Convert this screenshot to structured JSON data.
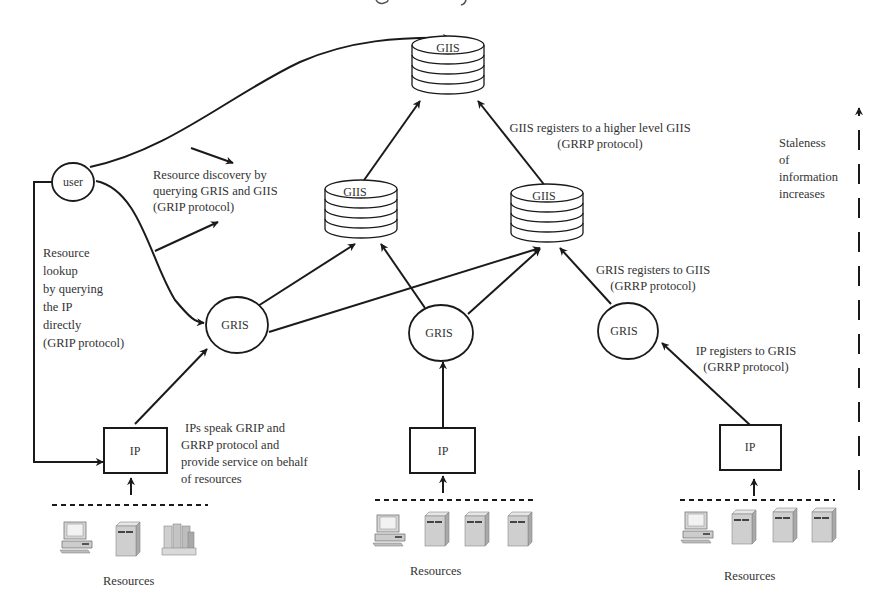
{
  "nodes": {
    "giis_top": {
      "label": "GIIS"
    },
    "giis_left": {
      "label": "GIIS"
    },
    "giis_right": {
      "label": "GIIS"
    },
    "user": {
      "label": "user"
    },
    "gris_left": {
      "label": "GRIS"
    },
    "gris_mid": {
      "label": "GRIS"
    },
    "gris_right": {
      "label": "GRIS"
    },
    "ip_left": {
      "label": "IP"
    },
    "ip_mid": {
      "label": "IP"
    },
    "ip_right": {
      "label": "IP"
    }
  },
  "annotations": {
    "discovery": [
      "Resource discovery by",
      "querying GRIS and GIIS",
      "(GRIP protocol)"
    ],
    "lookup": [
      "Resource",
      "lookup",
      "by querying",
      "the IP",
      "directly",
      "(GRIP protocol)"
    ],
    "giis_register": [
      "GIIS registers to a higher level GIIS",
      "(GRRP protocol)"
    ],
    "gris_register": [
      "GRIS registers to GIIS",
      "(GRRP protocol)"
    ],
    "ip_register": [
      "IP registers to GRIS",
      "(GRRP protocol)"
    ],
    "ip_speak": [
      "IPs speak GRIP and",
      "GRRP protocol and",
      "provide service on behalf",
      "of resources"
    ],
    "staleness": [
      "Staleness",
      "of",
      "information",
      "increases"
    ]
  },
  "resources": {
    "left": {
      "label": "Resources",
      "items": [
        "workstation-icon",
        "server-icon",
        "storage-array-icon"
      ]
    },
    "mid": {
      "label": "Resources",
      "items": [
        "workstation-icon",
        "server-icon",
        "server-icon",
        "server-icon"
      ]
    },
    "right": {
      "label": "Resources",
      "items": [
        "workstation-icon",
        "server-icon",
        "server-icon",
        "server-icon"
      ]
    }
  },
  "colors": {
    "line": "#1a1a1a",
    "text": "#333333",
    "device_fill": "#cfcfcf",
    "device_shade": "#a9a9a9"
  }
}
